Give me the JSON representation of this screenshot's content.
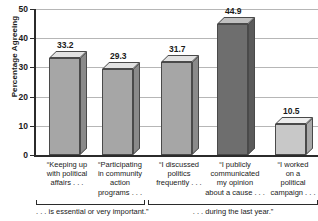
{
  "chart_data": {
    "type": "bar",
    "title": "",
    "xlabel": "",
    "ylabel": "Percentage Agreeing",
    "ylim": [
      0,
      50
    ],
    "ytick_labels": [
      "0",
      "10",
      "20",
      "30",
      "40",
      "50"
    ],
    "ytick_values": [
      0,
      10,
      20,
      30,
      40,
      50
    ],
    "grid": true,
    "legend": "none",
    "categories": [
      "“Keeping up with political affairs . . .",
      "“Participating in community action programs . . .",
      "“I discussed politics frequently . . .",
      "“I publicly communicated my opinion about a cause . . .",
      "“I worked on a political campaign . . ."
    ],
    "category_lines": [
      [
        "“Keeping up",
        "with political",
        "affairs . . ."
      ],
      [
        "“Participating",
        "in community",
        "action",
        "programs . . ."
      ],
      [
        "“I discussed",
        "politics",
        "frequently . . ."
      ],
      [
        "“I publicly",
        "communicated",
        "my opinion",
        "about a cause . . ."
      ],
      [
        "“I worked",
        "on a",
        "political",
        "campaign . . ."
      ]
    ],
    "values": [
      33.2,
      29.3,
      31.7,
      44.9,
      10.5
    ],
    "value_labels": [
      "33.2",
      "29.3",
      "31.7",
      "44.9",
      "10.5"
    ],
    "bar_colors": [
      "#a6a6a6",
      "#a6a6a6",
      "#a6a6a6",
      "#6e6e6e",
      "#c8c8c8"
    ],
    "bar_top_colors": [
      "#e2e2e2",
      "#e2e2e2",
      "#e2e2e2",
      "#c0c0c0",
      "#ececec"
    ],
    "bar_side_colors": [
      "#8a8a8a",
      "#8a8a8a",
      "#8a8a8a",
      "#5a5a5a",
      "#a9a9a9"
    ],
    "annotations": [
      {
        "name": "group-bracket-1",
        "caption": ". . . is essential or very important.”",
        "categories": [
          0,
          1
        ]
      },
      {
        "name": "group-bracket-2",
        "caption": ". . . during the last year.”",
        "categories": [
          2,
          3,
          4
        ]
      }
    ],
    "colors": {
      "axis": "#2b2b2b",
      "gridline": "#b6b6b6",
      "background": "#ffffff",
      "text": "#1a1a1a"
    }
  }
}
